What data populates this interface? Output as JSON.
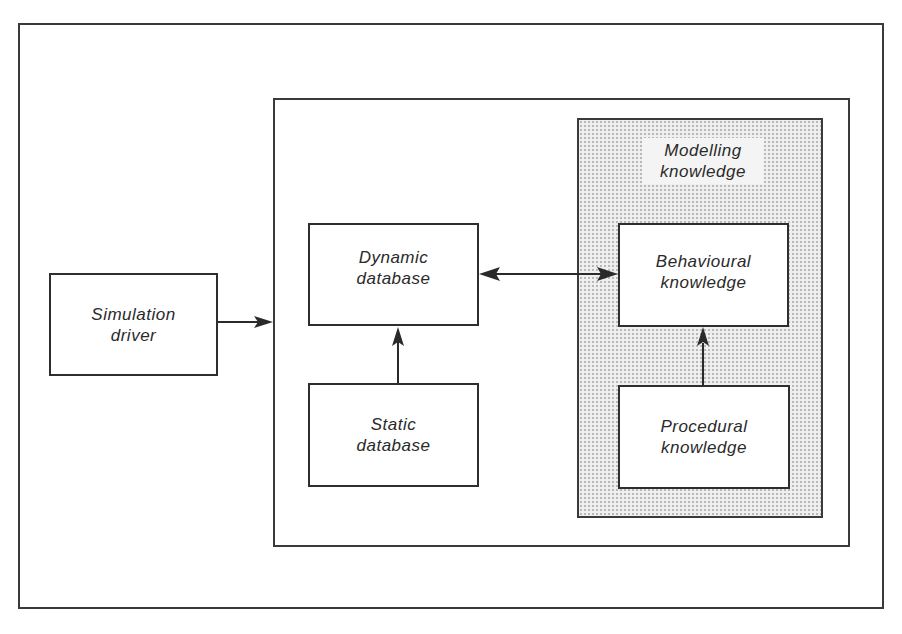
{
  "diagram": {
    "nodes": {
      "simulation_driver": {
        "line1": "Simulation",
        "line2": "driver"
      },
      "dynamic_database": {
        "line1": "Dynamic",
        "line2": "database"
      },
      "static_database": {
        "line1": "Static",
        "line2": "database"
      },
      "behavioural_knowledge": {
        "line1": "Behavioural",
        "line2": "knowledge"
      },
      "procedural_knowledge": {
        "line1": "Procedural",
        "line2": "knowledge"
      }
    },
    "groups": {
      "modelling_knowledge": {
        "line1": "Modelling",
        "line2": "knowledge"
      }
    },
    "edges": [
      {
        "from": "simulation_driver",
        "to": "inner_container",
        "type": "single-arrow"
      },
      {
        "from": "static_database",
        "to": "dynamic_database",
        "type": "single-arrow"
      },
      {
        "from": "dynamic_database",
        "to": "behavioural_knowledge",
        "type": "double-arrow"
      },
      {
        "from": "procedural_knowledge",
        "to": "behavioural_knowledge",
        "type": "single-arrow"
      }
    ]
  }
}
